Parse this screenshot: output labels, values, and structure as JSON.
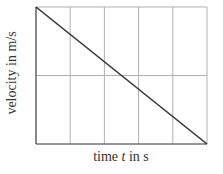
{
  "chart_data": {
    "type": "line",
    "title": "",
    "xlabel_prefix": "time ",
    "xlabel_var": "t",
    "xlabel_suffix": " in s",
    "xlabel": "time t in s",
    "ylabel": "velocity in m/s",
    "x_ticks": [],
    "y_ticks": [],
    "grid": {
      "vertical_divisions": 5,
      "horizontal_divisions": 2
    },
    "xlim": [
      0,
      5
    ],
    "ylim": [
      0,
      2
    ],
    "series": [
      {
        "name": "velocity",
        "x": [
          0,
          5
        ],
        "y": [
          2,
          0
        ],
        "color": "#333333"
      }
    ],
    "legend": null
  },
  "colors": {
    "grid": "#b0b0b0",
    "axis": "#555555",
    "line": "#333333"
  }
}
